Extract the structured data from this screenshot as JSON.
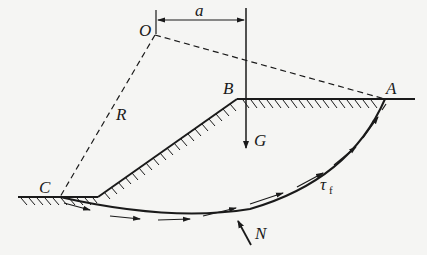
{
  "diagram": {
    "labels": {
      "center": "O",
      "moment_arm": "a",
      "radius": "R",
      "crest": "B",
      "top_exit": "A",
      "toe_exit": "C",
      "weight": "G",
      "normal_force": "N",
      "shear_strength": "τ",
      "shear_strength_sub": "f"
    },
    "colors": {
      "line": "#1a1a1a",
      "background": "#f5f5f3"
    }
  }
}
